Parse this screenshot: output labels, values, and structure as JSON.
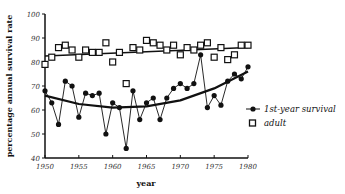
{
  "chart_data": {
    "type": "scatter",
    "title": "",
    "xlabel": "year",
    "ylabel": "percentage annual survival rate",
    "xlim": [
      1950,
      1980
    ],
    "ylim": [
      40,
      100
    ],
    "x_ticks": [
      1950,
      1955,
      1960,
      1965,
      1970,
      1975,
      1980
    ],
    "y_ticks": [
      40,
      50,
      60,
      70,
      80,
      90,
      100
    ],
    "grid": false,
    "legend_position": "right, lower-middle",
    "x": [
      1950,
      1951,
      1952,
      1953,
      1954,
      1955,
      1956,
      1957,
      1958,
      1959,
      1960,
      1961,
      1962,
      1963,
      1964,
      1965,
      1966,
      1967,
      1968,
      1969,
      1970,
      1971,
      1972,
      1973,
      1974,
      1975,
      1976,
      1977,
      1978,
      1979,
      1980
    ],
    "series": [
      {
        "name": "1st-year survival",
        "marker": "filled-circle",
        "connected": true,
        "values": [
          68,
          63,
          54,
          72,
          70,
          57,
          67,
          66,
          67,
          50,
          63,
          61,
          44,
          68,
          56,
          63,
          65,
          56,
          65,
          69,
          71,
          69,
          71,
          83,
          61,
          66,
          62,
          72,
          75,
          73,
          78
        ],
        "trend": {
          "type": "quadratic",
          "points": [
            [
              1950,
              66
            ],
            [
              1955,
              62.5
            ],
            [
              1960,
              61
            ],
            [
              1965,
              61.5
            ],
            [
              1970,
              64
            ],
            [
              1975,
              69
            ],
            [
              1980,
              76
            ]
          ]
        }
      },
      {
        "name": "adult",
        "marker": "open-square",
        "connected": false,
        "values": [
          79,
          82,
          86,
          87,
          85,
          82,
          85,
          84,
          84,
          88,
          80,
          84,
          71,
          86,
          85,
          89,
          88,
          87,
          85,
          87,
          83,
          86,
          85,
          87,
          88,
          82,
          86,
          81,
          83,
          87,
          87
        ],
        "trend": {
          "type": "linear",
          "points": [
            [
              1950,
              82.5
            ],
            [
              1980,
              86
            ]
          ]
        }
      }
    ]
  },
  "labels": {
    "xlabel": "year",
    "ylabel": "percentage annual survival rate",
    "legend": [
      "1st-year survival",
      "adult"
    ]
  }
}
